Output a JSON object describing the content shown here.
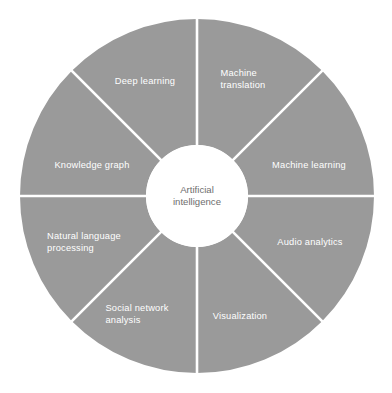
{
  "diagram": {
    "type": "donut-wheel",
    "title_center": "Artificial\nintelligence",
    "colors": {
      "sector_fill": "#9a9a9a",
      "divider": "#ffffff",
      "hub_fill": "#ffffff",
      "sector_label_text": "#ffffff",
      "hub_label_text": "#6e6e6e",
      "background": "#ffffff"
    },
    "geometry": {
      "center_x": 197,
      "center_y": 196,
      "outer_radius": 177,
      "inner_radius": 51,
      "sector_count": 8,
      "sector_span_degrees": 45,
      "divider_width": 2.6
    },
    "sectors": [
      {
        "id": "machine-translation",
        "label": "Machine\ntranslation",
        "start_angle": -90,
        "end_angle": -45,
        "label_x": 243,
        "label_y": 80
      },
      {
        "id": "machine-learning",
        "label": "Machine learning",
        "start_angle": -45,
        "end_angle": 0,
        "label_x": 309,
        "label_y": 166
      },
      {
        "id": "audio-analytics",
        "label": "Audio analytics",
        "start_angle": 0,
        "end_angle": 45,
        "label_x": 310,
        "label_y": 243
      },
      {
        "id": "visualization",
        "label": "Visualization",
        "start_angle": 45,
        "end_angle": 90,
        "label_x": 240,
        "label_y": 317
      },
      {
        "id": "social-network-analysis",
        "label": "Social network\nanalysis",
        "start_angle": 90,
        "end_angle": 135,
        "label_x": 137,
        "label_y": 315
      },
      {
        "id": "natural-language-processing",
        "label": "Natural language\nprocessing",
        "start_angle": 135,
        "end_angle": 180,
        "label_x": 84,
        "label_y": 243
      },
      {
        "id": "knowledge-graph",
        "label": "Knowledge graph",
        "start_angle": 180,
        "end_angle": 225,
        "label_x": 92,
        "label_y": 166
      },
      {
        "id": "deep-learning",
        "label": "Deep learning",
        "start_angle": 225,
        "end_angle": 270,
        "label_x": 145,
        "label_y": 82
      }
    ]
  }
}
